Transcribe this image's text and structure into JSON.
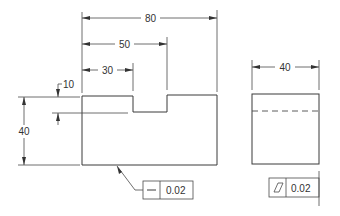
{
  "drawing": {
    "front_view": {
      "dimensions": {
        "overall_width": "80",
        "notch_right": "50",
        "notch_left": "30",
        "notch_depth": "10",
        "height": "40"
      },
      "feature_control_frame": {
        "symbol": "straightness",
        "symbol_glyph": "—",
        "tolerance": "0.02"
      }
    },
    "side_view": {
      "dimensions": {
        "width": "40"
      },
      "hidden_line": "notch-edge",
      "feature_control_frame": {
        "symbol": "flatness",
        "symbol_glyph": "▱",
        "tolerance": "0.02"
      }
    }
  }
}
